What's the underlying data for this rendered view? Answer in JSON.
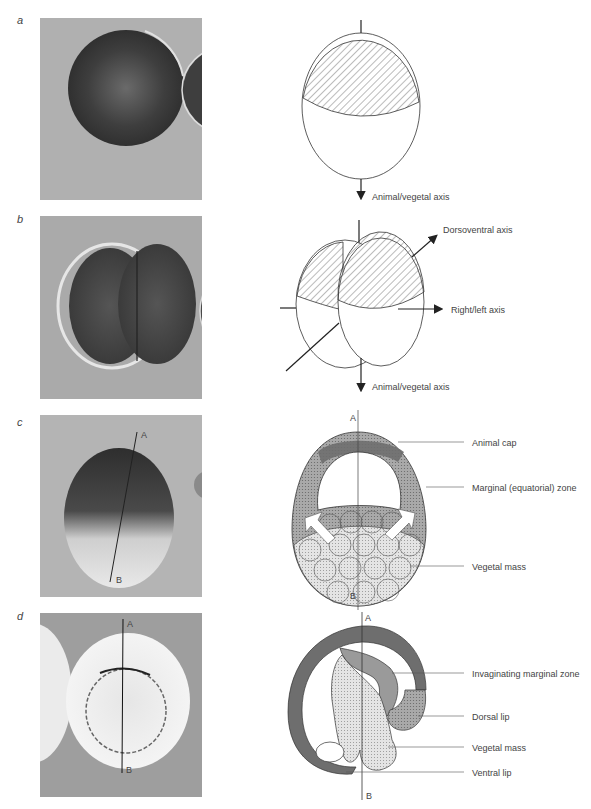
{
  "figure": {
    "panels": [
      {
        "id": "a",
        "label": "a",
        "photo": {
          "description": "single-cell frog egg, dark pigmented sphere"
        },
        "diagram": {
          "labels": {
            "axis": "Animal/vegetal axis"
          }
        }
      },
      {
        "id": "b",
        "label": "b",
        "photo": {
          "description": "two-cell stage embryo"
        },
        "diagram": {
          "labels": {
            "dorsoventral": "Dorsoventral axis",
            "right_left": "Right/left axis",
            "axis": "Animal/vegetal axis"
          }
        }
      },
      {
        "id": "c",
        "label": "c",
        "photo": {
          "description": "blastula with section line A-B",
          "line_top": "A",
          "line_bottom": "B"
        },
        "diagram": {
          "labels": {
            "top": "A",
            "bottom": "B",
            "animal_cap": "Animal cap",
            "marginal_zone": "Marginal (equatorial) zone",
            "vegetal_mass": "Vegetal mass"
          }
        }
      },
      {
        "id": "d",
        "label": "d",
        "photo": {
          "description": "gastrula with section line A-B",
          "line_top": "A",
          "line_bottom": "B"
        },
        "diagram": {
          "labels": {
            "top": "A",
            "bottom": "B",
            "invaginating": "Invaginating marginal zone",
            "dorsal_lip": "Dorsal lip",
            "vegetal_mass": "Vegetal mass",
            "ventral_lip": "Ventral lip"
          }
        }
      }
    ],
    "colors": {
      "photo_background": "#a8a8a8",
      "dark_tissue": "#6e6e6e",
      "medium_tissue": "#9a9a9a",
      "light_tissue": "#d6d6d6",
      "line": "#333333"
    }
  }
}
